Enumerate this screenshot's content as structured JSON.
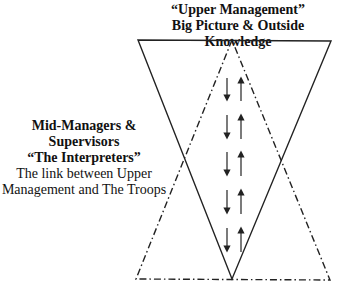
{
  "top_label": {
    "line1": "“Upper Management”",
    "line2": "Big Picture  & Outside Knowledge"
  },
  "side_label": {
    "line1": "Mid-Managers &",
    "line2": "Supervisors",
    "line3": "“The Interpreters”",
    "line4": "The link between Upper",
    "line5": "Management and The Troops"
  },
  "shapes": {
    "inverted_triangle": {
      "style": "solid",
      "points": [
        [
          138,
          40
        ],
        [
          331,
          41
        ],
        [
          232,
          279
        ]
      ]
    },
    "upright_triangle": {
      "style": "dash-dot",
      "points": [
        [
          232,
          40
        ],
        [
          136,
          279
        ],
        [
          330,
          280
        ]
      ]
    }
  },
  "arrows": {
    "down_x": 227,
    "up_x": 241,
    "pairs": [
      {
        "y1": 78,
        "y2": 100
      },
      {
        "y1": 115,
        "y2": 138
      },
      {
        "y1": 152,
        "y2": 175
      },
      {
        "y1": 190,
        "y2": 213
      },
      {
        "y1": 228,
        "y2": 251
      }
    ]
  }
}
